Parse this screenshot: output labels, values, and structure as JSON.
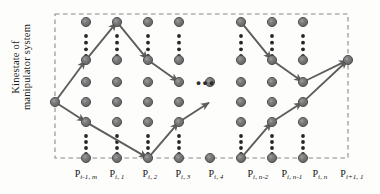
{
  "figure": {
    "type": "trellis-lattice-diagram",
    "y_axis_label": "Kinestate of\nmanipulator system",
    "colors": {
      "node_fill": "#6f6f6f",
      "node_stroke": "#4a4a4a",
      "node_highlight": "#5a5a5a",
      "path_line": "#5d5d5d",
      "border_dash": "#8a8a8a",
      "text": "#141414",
      "background": "#fdfdfc"
    },
    "ellipsis_horizontal": "•••",
    "border": {
      "style": "dashed",
      "left_x": 55,
      "right_x": 348,
      "top_y": 14,
      "bottom_y": 158
    }
  },
  "x_labels": [
    {
      "base": "P",
      "sub": "i-1, m",
      "x": 86
    },
    {
      "base": "P",
      "sub": "i, 1",
      "x": 117
    },
    {
      "base": "P",
      "sub": "i, 2",
      "x": 150
    },
    {
      "base": "P",
      "sub": "i, 3",
      "x": 183
    },
    {
      "base": "P",
      "sub": "i, 4",
      "x": 216
    },
    {
      "base": "P",
      "sub": "i, n-2",
      "x": 258
    },
    {
      "base": "P",
      "sub": "i, n-1",
      "x": 292
    },
    {
      "base": "P",
      "sub": "i, n",
      "x": 320
    },
    {
      "base": "P",
      "sub": "i+1, 1",
      "x": 352
    }
  ],
  "chart_data": {
    "type": "scatter",
    "title": "",
    "xlabel": "",
    "ylabel": "Kinestate of manipulator system",
    "columns": [
      {
        "label": "P(i-1,m)",
        "x": 86,
        "rows": [
          22,
          60,
          82,
          102,
          122,
          158
        ],
        "vdots": [
          [
            36,
            56
          ],
          [
            136,
            154
          ]
        ]
      },
      {
        "label": "P(i,1)",
        "x": 117,
        "rows": [
          22,
          60,
          82,
          102,
          122,
          158
        ],
        "vdots": [
          [
            36,
            56
          ],
          [
            136,
            154
          ]
        ]
      },
      {
        "label": "P(i,2)",
        "x": 148,
        "rows": [
          22,
          60,
          82,
          102,
          122,
          158
        ],
        "vdots": [
          [
            36,
            56
          ],
          [
            136,
            154
          ]
        ]
      },
      {
        "label": "P(i,3)",
        "x": 179,
        "rows": [
          22,
          60,
          82,
          102,
          122,
          158
        ],
        "vdots": [
          [
            36,
            56
          ],
          [
            136,
            154
          ]
        ]
      },
      {
        "label": "P(i,n-2)",
        "x": 241,
        "rows": [
          22,
          60,
          82,
          102,
          122,
          158
        ],
        "vdots": [
          [
            36,
            56
          ],
          [
            136,
            154
          ]
        ]
      },
      {
        "label": "P(i,n-1)",
        "x": 272,
        "rows": [
          22,
          60,
          82,
          102,
          122,
          158
        ],
        "vdots": [
          [
            36,
            56
          ],
          [
            136,
            154
          ]
        ]
      },
      {
        "label": "P(i,n)",
        "x": 303,
        "rows": [
          22,
          60,
          82,
          102,
          122,
          158
        ],
        "vdots": [
          [
            36,
            56
          ],
          [
            136,
            154
          ]
        ]
      }
    ],
    "extra_nodes": [
      {
        "label": "P(i-1,m) start",
        "x": 55,
        "y": 102
      },
      {
        "label": "P(i+1,1) end",
        "x": 348,
        "y": 60
      },
      {
        "label": "mid-low-a",
        "x": 210,
        "y": 82
      },
      {
        "label": "mid-low-b",
        "x": 210,
        "y": 158
      }
    ],
    "path": [
      {
        "from": [
          55,
          102
        ],
        "to": [
          86,
          60
        ]
      },
      {
        "from": [
          86,
          60
        ],
        "to": [
          117,
          22
        ]
      },
      {
        "from": [
          117,
          22
        ],
        "to": [
          148,
          60
        ]
      },
      {
        "from": [
          148,
          60
        ],
        "to": [
          179,
          82
        ]
      },
      {
        "from": [
          55,
          102
        ],
        "to": [
          86,
          122
        ]
      },
      {
        "from": [
          86,
          122
        ],
        "to": [
          148,
          158
        ]
      },
      {
        "from": [
          148,
          158
        ],
        "to": [
          179,
          122
        ]
      },
      {
        "from": [
          179,
          122
        ],
        "to": [
          210,
          102
        ]
      },
      {
        "from": [
          241,
          22
        ],
        "to": [
          272,
          60
        ]
      },
      {
        "from": [
          272,
          60
        ],
        "to": [
          303,
          82
        ]
      },
      {
        "from": [
          303,
          82
        ],
        "to": [
          348,
          60
        ]
      },
      {
        "from": [
          241,
          158
        ],
        "to": [
          272,
          122
        ]
      },
      {
        "from": [
          272,
          122
        ],
        "to": [
          303,
          102
        ]
      },
      {
        "from": [
          303,
          102
        ],
        "to": [
          348,
          60
        ]
      }
    ],
    "annotations": [
      "horizontal ellipsis between P(i,4) and P(i,n-2)"
    ]
  }
}
